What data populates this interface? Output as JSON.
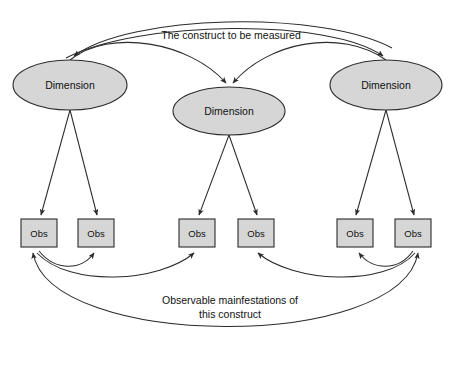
{
  "diagram": {
    "type": "construct-measurement-model",
    "canvas": {
      "width": 455,
      "height": 365,
      "background": "#ffffff"
    },
    "colors": {
      "node_fill": "#d6d6d6",
      "node_stroke": "#2b2b2b",
      "edge_stroke": "#2b2b2b",
      "text": "#111111"
    },
    "annotations": {
      "top_label": "The construct to be measured",
      "bottom_label_line1": "Observable mainfestations of",
      "bottom_label_line2": "this construct"
    },
    "dimensions": [
      {
        "id": "dim-left",
        "label": "Dimension",
        "cx": 70,
        "cy": 85,
        "rx": 57,
        "ry": 25
      },
      {
        "id": "dim-middle",
        "label": "Dimension",
        "cx": 229,
        "cy": 111,
        "rx": 56,
        "ry": 24
      },
      {
        "id": "dim-right",
        "label": "Dimension",
        "cx": 386,
        "cy": 85,
        "rx": 56,
        "ry": 25
      }
    ],
    "observations": [
      {
        "id": "obs-1",
        "label": "Obs",
        "x": 21,
        "y": 219,
        "width": 36,
        "height": 28
      },
      {
        "id": "obs-2",
        "label": "Obs",
        "x": 78,
        "y": 219,
        "width": 36,
        "height": 28
      },
      {
        "id": "obs-3",
        "label": "Obs",
        "x": 179,
        "y": 219,
        "width": 36,
        "height": 28
      },
      {
        "id": "obs-4",
        "label": "Obs",
        "x": 238,
        "y": 219,
        "width": 36,
        "height": 28
      },
      {
        "id": "obs-5",
        "label": "Obs",
        "x": 337,
        "y": 219,
        "width": 36,
        "height": 28
      },
      {
        "id": "obs-6",
        "label": "Obs",
        "x": 395,
        "y": 219,
        "width": 36,
        "height": 28
      }
    ],
    "construct_edges": [
      {
        "id": "construct-to-dim-left",
        "from": "construct",
        "to": "dim-left",
        "path": "M 392,48 C 320,10 130,14 74,56",
        "style": "curved-arrow"
      },
      {
        "id": "construct-to-dim-middle-left",
        "from": "construct",
        "to": "dim-middle",
        "path": "M 70,60 C 110,28 190,42 226,83",
        "style": "curved-arrow"
      },
      {
        "id": "construct-to-dim-middle-right",
        "from": "construct",
        "to": "dim-middle",
        "path": "M 386,60 C 340,28 268,42 233,83",
        "style": "curved-arrow"
      },
      {
        "id": "construct-to-dim-right",
        "from": "construct",
        "to": "dim-right",
        "path": "M 66,58 C 140,20 330,18 383,56",
        "style": "curved-arrow"
      }
    ],
    "dimension_edges": [
      {
        "id": "dim-left-to-obs-1",
        "from": "dim-left",
        "to": "obs-1",
        "path": "M 70,110 L 41,215",
        "style": "straight-arrow"
      },
      {
        "id": "dim-left-to-obs-2",
        "from": "dim-left",
        "to": "obs-2",
        "path": "M 70,110 L 97,215",
        "style": "straight-arrow"
      },
      {
        "id": "dim-middle-to-obs-3",
        "from": "dim-middle",
        "to": "obs-3",
        "path": "M 229,135 L 199,215",
        "style": "straight-arrow"
      },
      {
        "id": "dim-middle-to-obs-4",
        "from": "dim-middle",
        "to": "obs-4",
        "path": "M 229,135 L 257,215",
        "style": "straight-arrow"
      },
      {
        "id": "dim-right-to-obs-5",
        "from": "dim-right",
        "to": "obs-5",
        "path": "M 386,110 L 356,215",
        "style": "straight-arrow"
      },
      {
        "id": "dim-right-to-obs-6",
        "from": "dim-right",
        "to": "obs-6",
        "path": "M 386,110 L 414,215",
        "style": "straight-arrow"
      }
    ],
    "observation_edges": [
      {
        "id": "obs-1-to-obs-2",
        "from": "obs-1",
        "to": "obs-2",
        "path": "M 39,251 C 56,272 82,270 94,253",
        "style": "curved-arrow"
      },
      {
        "id": "obs-1-to-obs-3",
        "from": "obs-1",
        "to": "obs-3",
        "path": "M 37,253 C 70,288 160,282 194,253",
        "style": "curved-arrow"
      },
      {
        "id": "obs-6-to-obs-5",
        "from": "obs-6",
        "to": "obs-5",
        "path": "M 413,251 C 398,272 372,270 359,253",
        "style": "curved-arrow"
      },
      {
        "id": "obs-6-to-obs-4",
        "from": "obs-6",
        "to": "obs-4",
        "path": "M 415,253 C 384,288 292,282 258,253",
        "style": "curved-arrow"
      },
      {
        "id": "obs-1-to-obs-6",
        "from": "obs-1",
        "to": "obs-6",
        "path": "M 33,253 C 50,350 400,352 418,253",
        "style": "curved-arrow-bidirectional"
      }
    ]
  }
}
